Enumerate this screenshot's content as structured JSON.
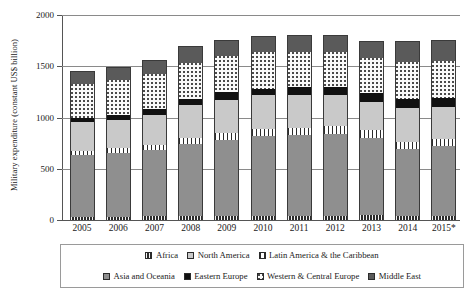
{
  "chart_data": {
    "type": "bar",
    "stacked": true,
    "title": "",
    "xlabel": "",
    "ylabel": "Military expenditure (constant US$ billion)",
    "ylim": [
      0,
      2000
    ],
    "yticks": [
      0,
      500,
      1000,
      1500,
      2000
    ],
    "grid": true,
    "legend_position": "bottom",
    "footnote_marker": "*",
    "categories": [
      "2005",
      "2006",
      "2007",
      "2008",
      "2009",
      "2010",
      "2011",
      "2012",
      "2013",
      "2014",
      "2015*"
    ],
    "series": [
      {
        "name": "Africa",
        "swatch": "checkered-dark",
        "color": "#2b2b2b",
        "values": [
          30,
          32,
          35,
          38,
          40,
          42,
          42,
          44,
          45,
          42,
          40
        ]
      },
      {
        "name": "Asia and Oceania",
        "swatch": "solid-gray",
        "color": "#8f8f8f",
        "values": [
          600,
          625,
          645,
          700,
          745,
          780,
          790,
          800,
          760,
          650,
          680
        ]
      },
      {
        "name": "Latin America & the Caribbean",
        "swatch": "vertical-stripe",
        "color": "#ffffff",
        "values": [
          45,
          48,
          55,
          60,
          65,
          68,
          70,
          72,
          75,
          72,
          68
        ]
      },
      {
        "name": "North America",
        "swatch": "light-gray",
        "color": "#c9c9c9",
        "values": [
          285,
          275,
          290,
          320,
          325,
          325,
          320,
          305,
          275,
          330,
          310
        ]
      },
      {
        "name": "Eastern Europe",
        "swatch": "solid-black",
        "color": "#111111",
        "values": [
          40,
          45,
          55,
          65,
          70,
          68,
          72,
          78,
          80,
          85,
          88
        ]
      },
      {
        "name": "Western & Central Europe",
        "swatch": "dotted-white",
        "color": "#fafafa",
        "values": [
          330,
          340,
          345,
          350,
          360,
          355,
          350,
          345,
          350,
          360,
          365
        ]
      },
      {
        "name": "Middle East",
        "swatch": "dark-gray",
        "color": "#5a5a5a",
        "values": [
          120,
          125,
          135,
          165,
          155,
          162,
          166,
          166,
          165,
          211,
          209
        ]
      }
    ],
    "totals": [
      1450,
      1490,
      1560,
      1698,
      1760,
      1800,
      1810,
      1810,
      1750,
      1750,
      1760
    ]
  },
  "legend": {
    "row1": [
      {
        "label": "Africa",
        "swatch": "checkered-dark"
      },
      {
        "label": "North America",
        "swatch": "light-gray"
      },
      {
        "label": "Latin America & the Caribbean",
        "swatch": "vertical-stripe"
      }
    ],
    "row2": [
      {
        "label": "Asia and Oceania",
        "swatch": "solid-gray"
      },
      {
        "label": "Eastern Europe",
        "swatch": "solid-black"
      },
      {
        "label": "Western & Central Europe",
        "swatch": "dotted-white"
      },
      {
        "label": "Middle East",
        "swatch": "dark-gray"
      }
    ]
  }
}
